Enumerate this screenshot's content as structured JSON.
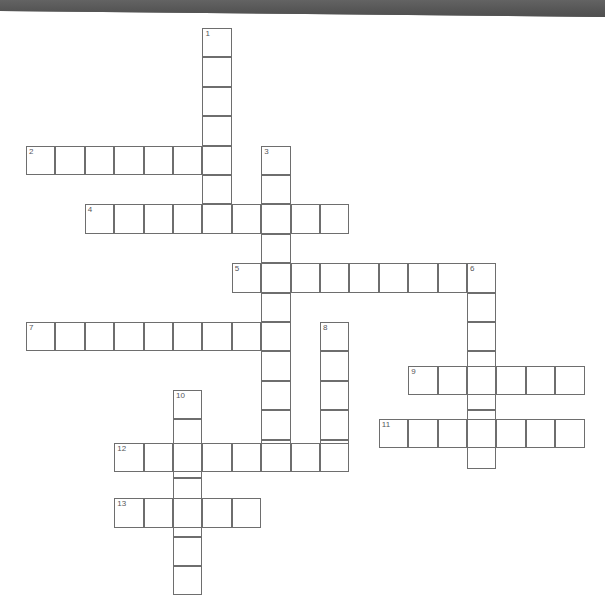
{
  "page": {
    "type": "crossword-puzzle-grid",
    "title": "",
    "background_color": "#ffffff"
  },
  "banner": {
    "name": "top-banner",
    "color": "#5a5a5a",
    "height_px": 18,
    "text": ""
  },
  "grid": {
    "cell_size": 29.4,
    "origin_x": 26,
    "origin_y": 10,
    "cell_fill": "#ffffff",
    "cell_border_color": "#6e6e6e",
    "number_color": "#55565a",
    "columns": 20,
    "rows": 20
  },
  "entries": [
    {
      "number": "1",
      "direction": "down",
      "col": 6,
      "row": 0,
      "length": 6,
      "answer": ""
    },
    {
      "number": "2",
      "direction": "across",
      "col": 0,
      "row": 4,
      "length": 7,
      "answer": ""
    },
    {
      "number": "3",
      "direction": "down",
      "col": 8,
      "row": 4,
      "length": 11,
      "answer": ""
    },
    {
      "number": "4",
      "direction": "across",
      "col": 2,
      "row": 6,
      "length": 9,
      "answer": ""
    },
    {
      "number": "5",
      "direction": "across",
      "col": 7,
      "row": 8,
      "length": 9,
      "answer": ""
    },
    {
      "number": "6",
      "direction": "down",
      "col": 15,
      "row": 8,
      "length": 7,
      "answer": ""
    },
    {
      "number": "7",
      "direction": "across",
      "col": 0,
      "row": 10,
      "length": 9,
      "answer": ""
    },
    {
      "number": "8",
      "direction": "down",
      "col": 10,
      "row": 10,
      "length": 5,
      "answer": ""
    },
    {
      "number": "9",
      "direction": "across",
      "col": 13,
      "row": 11.5,
      "length": 6,
      "answer": ""
    },
    {
      "number": "10",
      "direction": "down",
      "col": 5,
      "row": 12.3,
      "length": 7,
      "answer": ""
    },
    {
      "number": "11",
      "direction": "across",
      "col": 12,
      "row": 13.3,
      "length": 7,
      "answer": ""
    },
    {
      "number": "12",
      "direction": "across",
      "col": 3,
      "row": 14.1,
      "length": 8,
      "answer": ""
    },
    {
      "number": "13",
      "direction": "across",
      "col": 3,
      "row": 16.0,
      "length": 5,
      "answer": ""
    }
  ],
  "numbers_visible": [
    "1",
    "2",
    "3",
    "4",
    "5",
    "6",
    "7",
    "8",
    "9",
    "10",
    "11",
    "12",
    "13"
  ]
}
